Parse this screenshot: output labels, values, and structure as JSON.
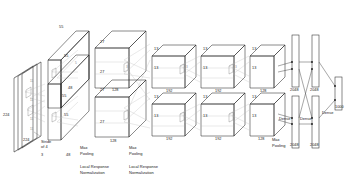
{
  "figure": {
    "background_color": "#ffffff",
    "line_color": "#2b2b2b",
    "text_color": "#1a1a1a"
  },
  "input": {
    "height_label": "224",
    "width_label": "224",
    "channels_label": "3",
    "stride_line1": "Stride",
    "stride_line2": "of 4",
    "kernel_top": "11",
    "kernel_mid": "11",
    "kernel_bottom": "11",
    "kernel_extra": "11"
  },
  "conv1": {
    "top_upper": "55",
    "side_upper": "55",
    "depth_upper": "48",
    "top_lower": "55",
    "side_lower": "55",
    "depth_lower": "48",
    "kernel": "5"
  },
  "conv2": {
    "top_upper": "27",
    "side_upper": "27",
    "depth_upper": "128",
    "top_lower": "27",
    "side_lower": "27",
    "depth_lower": "128",
    "kernel": "3"
  },
  "conv3": {
    "top_upper": "13",
    "side_upper": "13",
    "depth_upper": "192",
    "top_lower": "13",
    "side_lower": "13",
    "depth_lower": "192",
    "kernel": "3"
  },
  "conv4": {
    "top_upper": "13",
    "side_upper": "13",
    "depth_upper": "192",
    "top_lower": "13",
    "side_lower": "13",
    "depth_lower": "192",
    "kernel": "3"
  },
  "conv5": {
    "top_upper": "13",
    "side_upper": "13",
    "depth_upper": "128",
    "top_lower": "13",
    "side_lower": "13",
    "depth_lower": "128"
  },
  "fc": {
    "fc6_upper": "2048",
    "fc6_lower": "2048",
    "fc7_upper": "2048",
    "fc7_lower": "2048",
    "output": "1000",
    "dense_1": "Dense",
    "dense_2": "Dense",
    "dense_3": "Dense"
  },
  "operations": {
    "max_pool_1_line1": "Max",
    "max_pool_1_line2": "Pooling",
    "max_pool_2_line1": "Max",
    "max_pool_2_line2": "Pooling",
    "max_pool_3_line1": "Max",
    "max_pool_3_line2": "Pooling",
    "lrn_1_line1": "Local Response",
    "lrn_1_line2": "Normalization",
    "lrn_2_line1": "Local Response",
    "lrn_2_line2": "Normalization"
  }
}
